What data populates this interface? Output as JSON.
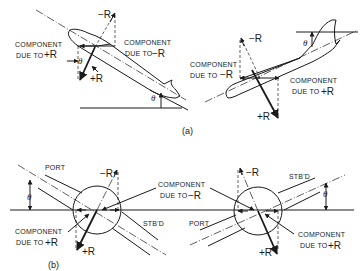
{
  "figure": {
    "part_a": {
      "caption": "(a)",
      "left_aircraft": {
        "neg_r_label": "−R",
        "pos_r_label": "+R",
        "component_pos_label_line1": "COMPONENT",
        "component_pos_label_line2": "DUE TO",
        "component_pos_symbol": "+R",
        "component_neg_label_line1": "COMPONENT",
        "component_neg_label_line2": "DUE TO",
        "component_neg_symbol": "−R",
        "theta_1": "θ",
        "theta_2": "θ"
      },
      "right_aircraft": {
        "neg_r_label": "−R",
        "pos_r_label": "+R",
        "component_neg_label_line1": "COMPONENT",
        "component_neg_label_line2": "DUE TO",
        "component_neg_symbol": "−R",
        "component_pos_label_line1": "COMPONENT",
        "component_pos_label_line2": "DUE TO",
        "component_pos_symbol": "+R",
        "theta": "θ"
      }
    },
    "part_b": {
      "caption": "(b)",
      "left_section": {
        "port_label": "PORT",
        "stbd_label": "STB'D",
        "neg_r_label": "−R",
        "pos_r_label": "+R",
        "component_pos_label_line1": "COMPONENT",
        "component_pos_label_line2": "DUE TO",
        "component_pos_symbol": "+R",
        "theta": "θ"
      },
      "shared_label": {
        "line1": "COMPONENT",
        "line2": "DUE TO",
        "symbol": "−R"
      },
      "right_section": {
        "port_label": "PORT",
        "stbd_label": "STB'D",
        "neg_r_label": "−R",
        "pos_r_label": "+R",
        "component_pos_label_line1": "COMPONENT",
        "component_pos_label_line2": "DUE TO",
        "component_pos_symbol": "+R",
        "theta": "θ"
      }
    }
  }
}
